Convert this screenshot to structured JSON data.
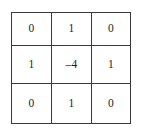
{
  "figure": {
    "name": "laplacian-kernel-matrix",
    "background_color": "#ffffff",
    "border_color": "#3a3a3a",
    "text_color": "#1b1b1b"
  },
  "chart_data": {
    "type": "table",
    "title": "",
    "subtitle": "",
    "xlabel": "",
    "ylabel": "",
    "grid": true,
    "legend": null,
    "rows": 3,
    "columns": 3,
    "column_headers": [],
    "row_headers": [],
    "cells": [
      [
        "0",
        "1",
        "0"
      ],
      [
        "1",
        "–4",
        "1"
      ],
      [
        "0",
        "1",
        "0"
      ]
    ],
    "values": [
      [
        0,
        1,
        0
      ],
      [
        1,
        -4,
        1
      ],
      [
        0,
        1,
        0
      ]
    ],
    "annotations": []
  }
}
